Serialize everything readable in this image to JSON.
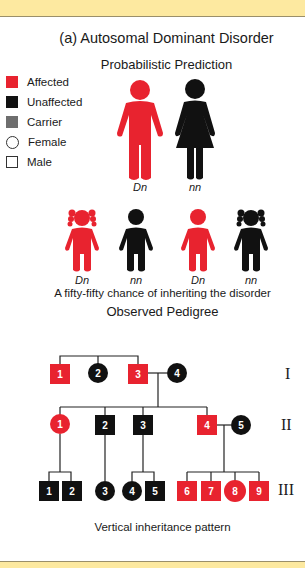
{
  "header": {
    "title": "(a)  Autosomal Dominant Disorder",
    "prediction_title": "Probabilistic Prediction",
    "pedigree_title": "Observed Pedigree"
  },
  "colors": {
    "affected": "#e8232f",
    "unaffected": "#111111",
    "carrier": "#6e6e6e",
    "banner": "#fde9a0"
  },
  "legend": {
    "items": [
      {
        "label": "Affected",
        "symbol": "filled-square-red"
      },
      {
        "label": "Unaffected",
        "symbol": "filled-square-black"
      },
      {
        "label": "Carrier",
        "symbol": "filled-square-gray"
      },
      {
        "label": "Female",
        "symbol": "open-circle"
      },
      {
        "label": "Male",
        "symbol": "open-square"
      }
    ]
  },
  "parents": [
    {
      "genotype": "Dn",
      "sex": "male",
      "status": "affected"
    },
    {
      "genotype": "nn",
      "sex": "female",
      "status": "unaffected"
    }
  ],
  "children": [
    {
      "genotype": "Dn",
      "sex": "female",
      "status": "affected"
    },
    {
      "genotype": "nn",
      "sex": "male",
      "status": "unaffected"
    },
    {
      "genotype": "Dn",
      "sex": "male",
      "status": "affected"
    },
    {
      "genotype": "nn",
      "sex": "female",
      "status": "unaffected"
    }
  ],
  "prediction_caption": "A fifty-fifty chance of inheriting the disorder",
  "pedigree": {
    "generations": [
      {
        "label": "I",
        "individuals": [
          {
            "id": "1",
            "sex": "male",
            "status": "affected"
          },
          {
            "id": "2",
            "sex": "female",
            "status": "unaffected"
          },
          {
            "id": "3",
            "sex": "male",
            "status": "affected"
          },
          {
            "id": "4",
            "sex": "female",
            "status": "unaffected"
          }
        ]
      },
      {
        "label": "II",
        "individuals": [
          {
            "id": "1",
            "sex": "female",
            "status": "affected"
          },
          {
            "id": "2",
            "sex": "male",
            "status": "unaffected"
          },
          {
            "id": "3",
            "sex": "male",
            "status": "unaffected"
          },
          {
            "id": "4",
            "sex": "male",
            "status": "affected"
          },
          {
            "id": "5",
            "sex": "female",
            "status": "unaffected"
          }
        ]
      },
      {
        "label": "III",
        "individuals": [
          {
            "id": "1",
            "sex": "male",
            "status": "unaffected"
          },
          {
            "id": "2",
            "sex": "male",
            "status": "unaffected"
          },
          {
            "id": "3",
            "sex": "female",
            "status": "unaffected"
          },
          {
            "id": "4",
            "sex": "female",
            "status": "unaffected"
          },
          {
            "id": "5",
            "sex": "male",
            "status": "unaffected"
          },
          {
            "id": "6",
            "sex": "male",
            "status": "affected"
          },
          {
            "id": "7",
            "sex": "male",
            "status": "affected"
          },
          {
            "id": "8",
            "sex": "female",
            "status": "affected"
          },
          {
            "id": "9",
            "sex": "male",
            "status": "affected"
          }
        ]
      }
    ],
    "caption": "Vertical inheritance pattern"
  }
}
